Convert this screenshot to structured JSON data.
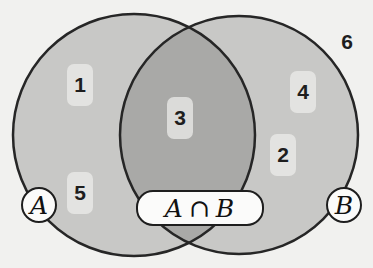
{
  "diagram": {
    "type": "venn",
    "colors": {
      "background": "#f1f1ef",
      "set_fill": "#c8c8c6",
      "intersection_fill": "#a9a9a7",
      "outline": "#262626",
      "label_box": "#ececea"
    },
    "sets": [
      {
        "id": "A",
        "label": "A",
        "cx": 134,
        "cy": 135,
        "r": 121
      },
      {
        "id": "B",
        "label": "B",
        "cx": 239,
        "cy": 135,
        "r": 119
      }
    ],
    "intersection": {
      "label_left": "A",
      "label_op": "∩",
      "label_right": "B"
    },
    "regions": [
      {
        "value": "1",
        "set": "A only",
        "x": 80,
        "y": 85
      },
      {
        "value": "5",
        "set": "A only",
        "x": 80,
        "y": 193
      },
      {
        "value": "3",
        "set": "A ∩ B",
        "x": 180,
        "y": 118
      },
      {
        "value": "4",
        "set": "B only",
        "x": 303,
        "y": 92
      },
      {
        "value": "2",
        "set": "B only",
        "x": 283,
        "y": 155
      },
      {
        "value": "6",
        "set": "outside",
        "x": 347,
        "y": 42
      }
    ]
  }
}
